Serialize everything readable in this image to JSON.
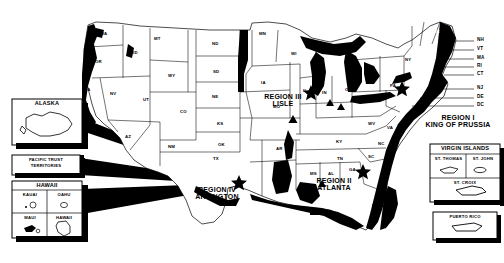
{
  "map": {
    "title": "United States Regional Offices Map",
    "colors": {
      "ink": "#000000",
      "paper": "#ffffff",
      "shading": "#000000"
    },
    "states": [
      {
        "ab": "WA",
        "x": 100,
        "y": 32
      },
      {
        "ab": "OR",
        "x": 95,
        "y": 60
      },
      {
        "ab": "CA",
        "x": 84,
        "y": 88
      },
      {
        "ab": "ID",
        "x": 133,
        "y": 51
      },
      {
        "ab": "NV",
        "x": 110,
        "y": 92
      },
      {
        "ab": "UT",
        "x": 143,
        "y": 98
      },
      {
        "ab": "AZ",
        "x": 125,
        "y": 135
      },
      {
        "ab": "MT",
        "x": 154,
        "y": 37
      },
      {
        "ab": "WY",
        "x": 168,
        "y": 74
      },
      {
        "ab": "CO",
        "x": 180,
        "y": 110
      },
      {
        "ab": "NM",
        "x": 168,
        "y": 145
      },
      {
        "ab": "ND",
        "x": 212,
        "y": 42
      },
      {
        "ab": "SD",
        "x": 213,
        "y": 70
      },
      {
        "ab": "NE",
        "x": 212,
        "y": 95
      },
      {
        "ab": "KS",
        "x": 217,
        "y": 122
      },
      {
        "ab": "OK",
        "x": 218,
        "y": 143
      },
      {
        "ab": "TX",
        "x": 213,
        "y": 157
      },
      {
        "ab": "MN",
        "x": 259,
        "y": 32
      },
      {
        "ab": "IA",
        "x": 261,
        "y": 81
      },
      {
        "ab": "MO",
        "x": 273,
        "y": 105
      },
      {
        "ab": "AR",
        "x": 276,
        "y": 147
      },
      {
        "ab": "LA",
        "x": 280,
        "y": 175
      },
      {
        "ab": "WI",
        "x": 291,
        "y": 52
      },
      {
        "ab": "IL",
        "x": 303,
        "y": 89
      },
      {
        "ab": "MS",
        "x": 310,
        "y": 172
      },
      {
        "ab": "MI",
        "x": 331,
        "y": 61
      },
      {
        "ab": "IN",
        "x": 322,
        "y": 91
      },
      {
        "ab": "OH",
        "x": 345,
        "y": 88
      },
      {
        "ab": "KY",
        "x": 336,
        "y": 140
      },
      {
        "ab": "TN",
        "x": 337,
        "y": 157
      },
      {
        "ab": "AL",
        "x": 328,
        "y": 172
      },
      {
        "ab": "GA",
        "x": 349,
        "y": 168
      },
      {
        "ab": "FL",
        "x": 372,
        "y": 204
      },
      {
        "ab": "SC",
        "x": 368,
        "y": 155
      },
      {
        "ab": "NC",
        "x": 378,
        "y": 142
      },
      {
        "ab": "WV",
        "x": 368,
        "y": 122
      },
      {
        "ab": "VA",
        "x": 387,
        "y": 126
      },
      {
        "ab": "PA",
        "x": 390,
        "y": 84
      },
      {
        "ab": "NY",
        "x": 405,
        "y": 58
      },
      {
        "ab": "ME",
        "x": 433,
        "y": 30
      },
      {
        "ab": "MD",
        "x": 397,
        "y": 100
      }
    ],
    "leader_labels": [
      {
        "ab": "NH",
        "x": 477,
        "y": 42
      },
      {
        "ab": "VT",
        "x": 477,
        "y": 51
      },
      {
        "ab": "MA",
        "x": 477,
        "y": 60
      },
      {
        "ab": "RI",
        "x": 477,
        "y": 68
      },
      {
        "ab": "CT",
        "x": 477,
        "y": 76
      },
      {
        "ab": "NJ",
        "x": 477,
        "y": 90
      },
      {
        "ab": "DE",
        "x": 477,
        "y": 99
      },
      {
        "ab": "DC",
        "x": 477,
        "y": 107
      }
    ],
    "regions": [
      {
        "id": "region-1",
        "name": "REGION I",
        "city": "KING OF PRUSSIA",
        "label_x": 448,
        "label_y": 118,
        "star_x": 402,
        "star_y": 88
      },
      {
        "id": "region-2",
        "name": "REGION II",
        "city": "ATLANTA",
        "label_x": 333,
        "label_y": 178,
        "star_x": 363,
        "star_y": 171
      },
      {
        "id": "region-3",
        "name": "REGION III",
        "city": "LISLE",
        "label_x": 281,
        "label_y": 96,
        "star_x": 311,
        "star_y": 92
      },
      {
        "id": "region-4",
        "name": "REGION IV",
        "city": "ARLINGTON",
        "label_x": 213,
        "label_y": 188,
        "star_x": 239,
        "star_y": 182
      }
    ],
    "triangles": [
      {
        "x": 293,
        "y": 119
      },
      {
        "x": 330,
        "y": 103
      },
      {
        "x": 341,
        "y": 107
      },
      {
        "x": 322,
        "y": 184
      }
    ]
  },
  "insets": {
    "alaska": {
      "label": "ALASKA",
      "x": 12,
      "y": 99,
      "w": 70,
      "h": 46
    },
    "pacific": {
      "line1": "PACIFIC TRUST",
      "line2": "TERRITORIES",
      "x": 12,
      "y": 155,
      "w": 68,
      "h": 20
    },
    "hawaii": {
      "label": "HAWAII",
      "x": 12,
      "y": 181,
      "w": 70,
      "h": 57,
      "cells": [
        {
          "label": "KAUAI"
        },
        {
          "label": "OAHU"
        },
        {
          "label": "MAUI"
        },
        {
          "label": "HAWAII"
        }
      ]
    },
    "virgin_islands": {
      "label": "VIRGIN ISLANDS",
      "x": 430,
      "y": 144,
      "w": 70,
      "h": 58,
      "cells": [
        {
          "label": "ST. THOMAS"
        },
        {
          "label": "ST. JOHN"
        },
        {
          "label": "ST. CROIX"
        }
      ]
    },
    "puerto_rico": {
      "label": "PUERTO RICO",
      "x": 433,
      "y": 212,
      "w": 64,
      "h": 28
    }
  }
}
